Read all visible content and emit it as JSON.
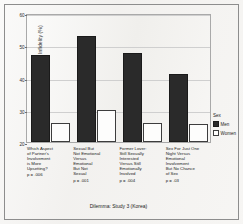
{
  "figure": {
    "background_color": "#f2f1ef",
    "frame_color": "#8d8d8d"
  },
  "chart_data": {
    "type": "bar",
    "title": "",
    "xlabel": "Dilemma: Study 3 (Korea)",
    "ylabel": "More Distress to Sexual Infidelity (%)",
    "ylim": [
      20,
      60
    ],
    "yticks": [
      20,
      30,
      40,
      50,
      60
    ],
    "ytick_labels": [
      "20",
      "30",
      "40",
      "50",
      "60"
    ],
    "grid": true,
    "legend_position": "right",
    "categories": [
      "Which Aspect of Partner's Involvement is More Upsetting?",
      "Sexual But Not Emotional Versus Emotional But Not Sexual",
      "Former Lover: Still Sexually Interested Versus Still Emotionally Involved",
      "Sex For Just One Night Versus Emotional Involvement But No Chance of Sex"
    ],
    "category_lines": [
      [
        "Which Aspect",
        "of Partner's",
        "Involvement",
        "is More",
        "Upsetting?"
      ],
      [
        "Sexual But",
        "Not Emotional",
        "Versus",
        "Emotional",
        "But Not",
        "Sexual"
      ],
      [
        "Former Lover:",
        "Still Sexually",
        "Interested",
        "Versus Still",
        "Emotionally",
        "Involved"
      ],
      [
        "Sex For Just One",
        "Night Versus",
        "Emotional",
        "Involvement",
        "But No Chance",
        "of Sex"
      ]
    ],
    "annotations": [
      "p = .006",
      "p = .001",
      "p = .004",
      "p = .03"
    ],
    "series": [
      {
        "name": "Men",
        "color": "#2a2a2a",
        "values": [
          47,
          53,
          47.5,
          41
        ]
      },
      {
        "name": "Women",
        "color": "#fdfdfc",
        "values": [
          26,
          30,
          26,
          25.5
        ]
      }
    ]
  },
  "legend": {
    "title": "Sex",
    "entries": [
      {
        "label": "Men"
      },
      {
        "label": "Women"
      }
    ]
  }
}
